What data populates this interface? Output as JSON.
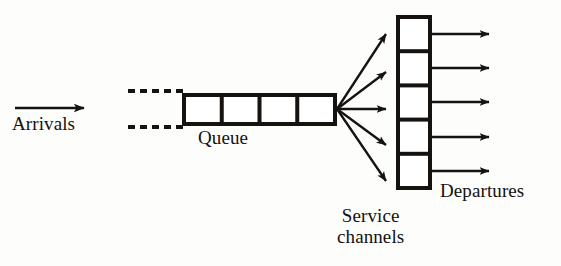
{
  "diagram": {
    "type": "flow-diagram",
    "canvas": {
      "width": 561,
      "height": 266,
      "background": "#fdfdfc"
    },
    "stroke_color": "#151210",
    "labels": {
      "arrivals": "Arrivals",
      "queue": "Queue",
      "service_channels_line1": "Service",
      "service_channels_line2": "channels",
      "departures": "Departures"
    },
    "arrivals": {
      "arrow_count": 1,
      "x_start": 15,
      "x_end": 92,
      "y": 108
    },
    "dashed_connectors": {
      "count": 2,
      "x_start": 128,
      "x_end": 182,
      "y_top": 91,
      "y_bottom": 127,
      "dash_length": 7,
      "gap_length": 5
    },
    "queue": {
      "cell_count": 4,
      "x_left": 182,
      "x_right": 337,
      "y_top": 93,
      "y_bottom": 126,
      "stroke_width": 4
    },
    "fan": {
      "origin_x": 337,
      "origin_y": 109,
      "branch_count": 5,
      "target_x": 394
    },
    "service_channels": {
      "count": 5,
      "x_left": 396,
      "x_right": 432,
      "y_top": 15,
      "y_bottom": 190,
      "stroke_width": 4
    },
    "departures": {
      "arrow_count": 5,
      "x_start": 432,
      "x_end": 497
    }
  }
}
